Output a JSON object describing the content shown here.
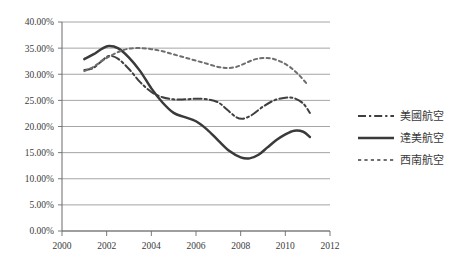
{
  "chart_data": {
    "type": "line",
    "title": "",
    "subtitle": "",
    "xlabel": "",
    "ylabel": "",
    "xlim": [
      2000,
      2012
    ],
    "ylim": [
      0,
      0.4
    ],
    "grid": true,
    "legend_position": "right",
    "x_ticks": [
      "2000",
      "2002",
      "2004",
      "2006",
      "2008",
      "2010",
      "2012"
    ],
    "x_tick_values": [
      2000,
      2002,
      2004,
      2006,
      2008,
      2010,
      2012
    ],
    "y_ticks": [
      "0.00%",
      "5.00%",
      "10.00%",
      "15.00%",
      "20.00%",
      "25.00%",
      "30.00%",
      "35.00%",
      "40.00%"
    ],
    "y_tick_values": [
      0,
      5,
      10,
      15,
      20,
      25,
      30,
      35,
      40
    ],
    "series": [
      {
        "name": "美國航空",
        "style": "dash-dot",
        "color": "#3f3f3f",
        "x": [
          2001.0,
          2001.4,
          2001.8,
          2002.1,
          2002.5,
          2003.0,
          2003.5,
          2004.0,
          2004.5,
          2005.0,
          2005.5,
          2006.0,
          2006.5,
          2007.0,
          2007.4,
          2007.8,
          2008.1,
          2008.5,
          2009.0,
          2009.5,
          2010.0,
          2010.4,
          2010.8,
          2011.1
        ],
        "values": [
          30.8,
          31.2,
          32.6,
          33.5,
          33.0,
          31.0,
          28.5,
          26.6,
          25.6,
          25.2,
          25.2,
          25.3,
          25.2,
          24.6,
          23.2,
          21.8,
          21.5,
          22.2,
          23.8,
          25.0,
          25.5,
          25.4,
          24.4,
          22.6
        ]
      },
      {
        "name": "達美航空",
        "style": "solid",
        "color": "#3a3a3a",
        "x": [
          2001.0,
          2001.4,
          2001.8,
          2002.1,
          2002.5,
          2003.0,
          2003.5,
          2004.0,
          2004.5,
          2005.0,
          2005.5,
          2006.0,
          2006.5,
          2007.0,
          2007.5,
          2008.0,
          2008.4,
          2008.8,
          2009.2,
          2009.6,
          2010.0,
          2010.4,
          2010.8,
          2011.1
        ],
        "values": [
          32.9,
          33.8,
          34.9,
          35.4,
          35.0,
          33.2,
          30.6,
          27.3,
          24.6,
          22.6,
          21.8,
          21.0,
          19.4,
          17.3,
          15.3,
          14.1,
          13.9,
          14.6,
          16.0,
          17.4,
          18.5,
          19.2,
          19.0,
          18.0
        ]
      },
      {
        "name": "西南航空",
        "style": "dashed",
        "color": "#6e6e6e",
        "x": [
          2001.0,
          2001.4,
          2001.8,
          2002.2,
          2002.6,
          2003.0,
          2003.5,
          2004.0,
          2004.5,
          2005.0,
          2005.5,
          2006.0,
          2006.5,
          2007.0,
          2007.4,
          2007.8,
          2008.2,
          2008.6,
          2009.0,
          2009.4,
          2009.8,
          2010.2,
          2010.6,
          2011.0
        ],
        "values": [
          30.6,
          31.4,
          32.6,
          33.6,
          34.4,
          34.9,
          35.0,
          34.8,
          34.4,
          33.8,
          33.2,
          32.6,
          32.0,
          31.4,
          31.2,
          31.4,
          32.1,
          32.8,
          33.1,
          33.0,
          32.4,
          31.4,
          29.9,
          28.0
        ]
      }
    ]
  },
  "legend": {
    "items": [
      {
        "label": "美國航空",
        "style": "dash-dot"
      },
      {
        "label": "達美航空",
        "style": "solid"
      },
      {
        "label": "西南航空",
        "style": "dashed"
      }
    ]
  }
}
